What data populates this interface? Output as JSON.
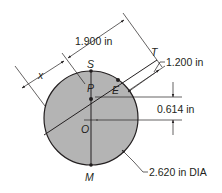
{
  "figure": {
    "type": "engineering-dimension-drawing",
    "colors": {
      "disk_fill": "#b4b4b4",
      "line": "#231f20",
      "background": "#ffffff"
    },
    "circle": {
      "center_label": "O",
      "diameter_label": "2.620 in DIA"
    },
    "points": {
      "S": "S",
      "P": "P",
      "E": "E",
      "O": "O",
      "M": "M",
      "T": "T"
    },
    "dimensions": {
      "x": "x",
      "d1": "1.900 in",
      "d2": "1.200 in",
      "d3": "0.614 in",
      "diameter": "2.620 in DIA"
    }
  }
}
